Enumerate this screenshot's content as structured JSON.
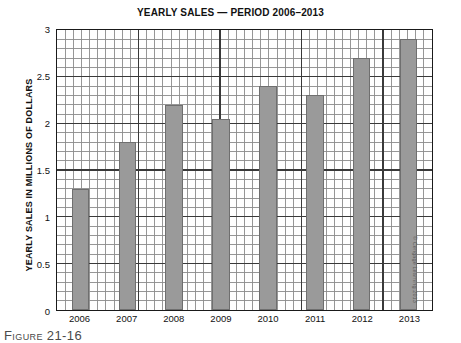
{
  "chart_data": {
    "type": "bar",
    "title": "YEARLY SALES — PERIOD 2006–2013",
    "xlabel": "",
    "ylabel": "YEARLY SALES IN MILLIONS OF DOLLARS",
    "categories": [
      "2006",
      "2007",
      "2008",
      "2009",
      "2010",
      "2011",
      "2012",
      "2013"
    ],
    "values": [
      1.3,
      1.8,
      2.2,
      2.05,
      2.4,
      2.3,
      2.7,
      2.9
    ],
    "ylim": [
      0,
      3
    ],
    "y_ticks": [
      "0",
      "0.5",
      "1",
      "1.5",
      "2",
      "2.5",
      "3"
    ],
    "y_tick_values": [
      0,
      0.5,
      1,
      1.5,
      2,
      2.5,
      3
    ],
    "grid": "major and minor grid on, minor step 0.1",
    "legend": "none",
    "bar_color": "#9a9a9a",
    "bar_border_color": "#6f6f6f",
    "axis_color": "#1a1a1a",
    "major_grid_color": "#3a3a3a",
    "minor_grid_color": "#8c8c8c"
  },
  "caption": {
    "text": "Figure 21-16"
  },
  "credit": {
    "text": "© Cengage Learning 2013"
  }
}
